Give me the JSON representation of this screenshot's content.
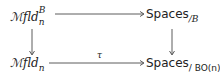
{
  "diagram": {
    "type": "commutative-square",
    "nodes": {
      "top_left": {
        "base": "ℳfld",
        "sub": "n",
        "sup": "B"
      },
      "top_right": {
        "base": "Spaces",
        "sub": "/B"
      },
      "bottom_left": {
        "base": "ℳfld",
        "sub": "n"
      },
      "bottom_right": {
        "base": "Spaces",
        "sub": "/ BO(n)",
        "trailing": "."
      }
    },
    "arrows": [
      {
        "from": "top_left",
        "to": "top_right",
        "label": ""
      },
      {
        "from": "top_left",
        "to": "bottom_left",
        "label": ""
      },
      {
        "from": "top_right",
        "to": "bottom_right",
        "label": ""
      },
      {
        "from": "bottom_left",
        "to": "bottom_right",
        "label": "τ"
      }
    ]
  }
}
